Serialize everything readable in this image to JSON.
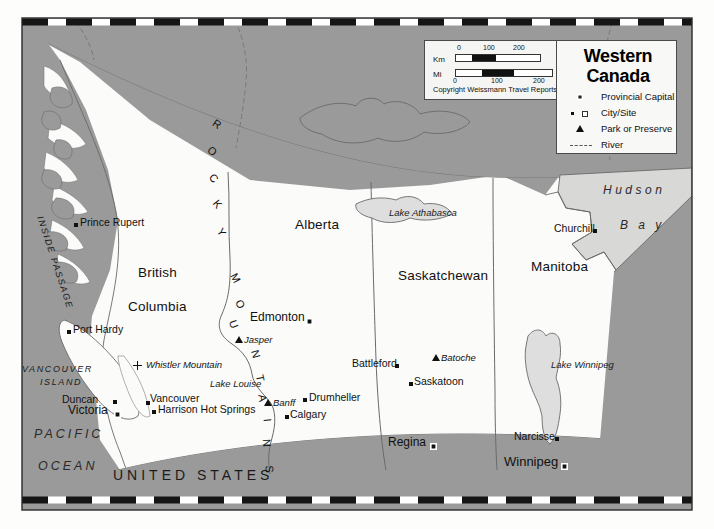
{
  "map": {
    "title_line1": "Western",
    "title_line2": "Canada",
    "copyright": "Copyright Weissmann Travel Reports",
    "colors": {
      "land": "#fcfcfb",
      "neighbor_gray": "#9a9a9a",
      "water_gray": "#d6d6d4",
      "lake_fill": "#dedede",
      "border_line": "#555555",
      "ink": "#111111"
    }
  },
  "scale": {
    "km_label": "Km",
    "mi_label": "Mi",
    "km_ticks": [
      "0",
      "100",
      "200"
    ],
    "mi_ticks": [
      "0",
      "100",
      "200"
    ]
  },
  "legend": {
    "items": [
      {
        "symbol": "provincial-capital-square",
        "label": "Provincial Capital"
      },
      {
        "symbol": "city-site-squares",
        "label": "City/Site"
      },
      {
        "symbol": "park-triangle",
        "label": "Park or Preserve"
      },
      {
        "symbol": "river-dashed-line",
        "label": "River"
      }
    ]
  },
  "provinces": [
    {
      "name": "British\nColumbia",
      "line1": "British",
      "line2": "Columbia",
      "x": 138,
      "y": 266
    },
    {
      "name": "Alberta",
      "line1": "Alberta",
      "x": 295,
      "y": 218
    },
    {
      "name": "Saskatchewan",
      "line1": "Saskatchewan",
      "x": 398,
      "y": 269
    },
    {
      "name": "Manitoba",
      "line1": "Manitoba",
      "x": 531,
      "y": 260
    }
  ],
  "water_labels": [
    {
      "text": "PACIFIC",
      "x": 34,
      "y": 428
    },
    {
      "text": "OCEAN",
      "x": 38,
      "y": 460
    },
    {
      "text": "Hudson",
      "x": 603,
      "y": 184
    },
    {
      "text": "B a y",
      "x": 620,
      "y": 219
    }
  ],
  "region_labels": [
    {
      "text": "INSIDE PASSAGE",
      "x": 44,
      "y": 215
    },
    {
      "text": "VANCOUVER",
      "x": 22,
      "y": 365
    },
    {
      "text": "ISLAND",
      "x": 40,
      "y": 378
    },
    {
      "text": "UNITED STATES",
      "x": 113,
      "y": 468
    }
  ],
  "mountain_range": {
    "text": "ROCKY MOUNTAINS",
    "letters": [
      "R",
      "O",
      "C",
      "K",
      "Y",
      "M",
      "O",
      "U",
      "N",
      "T",
      "A",
      "I",
      "N",
      "S"
    ]
  },
  "lakes": [
    {
      "name": "Lake Athabasca",
      "x": 389,
      "y": 208
    },
    {
      "name": "Lake Winnipeg",
      "x": 551,
      "y": 360
    },
    {
      "name": "Lake Louise",
      "x": 210,
      "y": 379
    }
  ],
  "places": [
    {
      "name": "Prince Rupert",
      "type": "city",
      "mx": 74,
      "my": 223,
      "lx": 80,
      "ly": 217
    },
    {
      "name": "Port Hardy",
      "type": "city",
      "mx": 67,
      "my": 330,
      "lx": 73,
      "ly": 324
    },
    {
      "name": "Duncan",
      "type": "city",
      "mx": 113,
      "my": 400,
      "lx": 62,
      "ly": 394
    },
    {
      "name": "Victoria",
      "type": "capital",
      "mx": 114,
      "my": 411,
      "lx": 72,
      "ly": 405
    },
    {
      "name": "Vancouver",
      "type": "city",
      "mx": 146,
      "my": 401,
      "lx": 150,
      "ly": 394
    },
    {
      "name": "Harrison Hot Springs",
      "type": "city",
      "mx": 152,
      "my": 410,
      "lx": 158,
      "ly": 404
    },
    {
      "name": "Whistler Mountain",
      "type": "plus",
      "mx": 133,
      "my": 365,
      "lx": 145,
      "ly": 361
    },
    {
      "name": "Edmonton",
      "type": "capital",
      "mx": 306,
      "my": 318,
      "lx": 250,
      "ly": 311
    },
    {
      "name": "Jasper",
      "type": "park",
      "mx": 236,
      "my": 340,
      "lx": 243,
      "ly": 336
    },
    {
      "name": "Banff",
      "type": "park",
      "mx": 266,
      "my": 403,
      "lx": 273,
      "ly": 399
    },
    {
      "name": "Calgary",
      "type": "city",
      "mx": 285,
      "my": 415,
      "lx": 290,
      "ly": 409
    },
    {
      "name": "Drumheller",
      "type": "city",
      "mx": 303,
      "my": 398,
      "lx": 309,
      "ly": 392
    },
    {
      "name": "Battleford",
      "type": "city",
      "mx": 395,
      "my": 364,
      "lx": 352,
      "ly": 358
    },
    {
      "name": "Batoche",
      "type": "park",
      "mx": 433,
      "my": 358,
      "lx": 441,
      "ly": 354
    },
    {
      "name": "Saskatoon",
      "type": "city",
      "mx": 409,
      "my": 382,
      "lx": 414,
      "ly": 376
    },
    {
      "name": "Regina",
      "type": "capital",
      "mx": 430,
      "my": 444,
      "lx": 390,
      "ly": 437
    },
    {
      "name": "Churchill",
      "type": "city",
      "mx": 593,
      "my": 229,
      "lx": 555,
      "ly": 223
    },
    {
      "name": "Narcisse",
      "type": "city",
      "mx": 555,
      "my": 437,
      "lx": 515,
      "ly": 431
    },
    {
      "name": "Winnipeg",
      "type": "capital",
      "mx": 561,
      "my": 464,
      "lx": 506,
      "ly": 456
    }
  ]
}
